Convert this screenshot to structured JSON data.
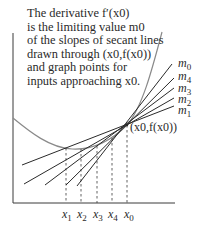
{
  "caption": {
    "lines": [
      "The derivative f′(x0)",
      "is the limiting value m0",
      "of the slopes of secant lines",
      "drawn through (x0,f(x0))",
      "and graph points for",
      "inputs approaching x0."
    ]
  },
  "point_label": "(x0,f(x0))",
  "slope_labels": [
    {
      "name": "m",
      "sub": "0"
    },
    {
      "name": "m",
      "sub": "4"
    },
    {
      "name": "m",
      "sub": "3"
    },
    {
      "name": "m",
      "sub": "2"
    },
    {
      "name": "m",
      "sub": "1"
    }
  ],
  "x_labels": [
    {
      "name": "x",
      "sub": "1"
    },
    {
      "name": "x",
      "sub": "2"
    },
    {
      "name": "x",
      "sub": "3"
    },
    {
      "name": "x",
      "sub": "4"
    },
    {
      "name": "x",
      "sub": "0"
    }
  ],
  "colors": {
    "ink": "#2a2a2a",
    "curve": "#8a8a8a",
    "background": "#ffffff"
  }
}
